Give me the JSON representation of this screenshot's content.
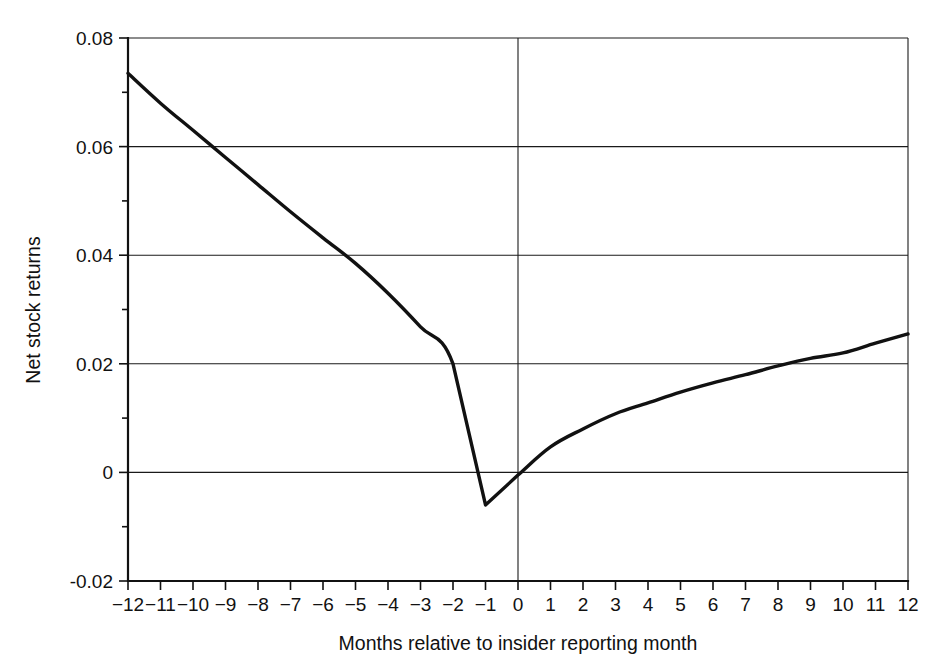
{
  "chart_data": {
    "type": "line",
    "title": "",
    "xlabel": "Months relative to insider reporting month",
    "ylabel": "Net stock returns",
    "xlim": [
      -12,
      12
    ],
    "ylim": [
      -0.02,
      0.08
    ],
    "grid": true,
    "legend": "none",
    "x_tick_labels": [
      "-12",
      "-11",
      "-10",
      "-9",
      "-8",
      "-7",
      "-6",
      "-5",
      "-4",
      "-3",
      "-2",
      "-1",
      "0",
      "1",
      "2",
      "3",
      "4",
      "5",
      "6",
      "7",
      "8",
      "9",
      "10",
      "11",
      "12"
    ],
    "y_tick_labels": [
      "0.08",
      "0.06",
      "0.04",
      "0.02",
      "0",
      "-0.02"
    ],
    "y_tick_values": [
      0.08,
      0.06,
      0.04,
      0.02,
      0,
      -0.02
    ],
    "y_minor_ticks": [
      0.07,
      0.05,
      0.03,
      0.01,
      -0.01
    ],
    "x": [
      -12,
      -11,
      -10,
      -9,
      -8,
      -7,
      -6,
      -5,
      -4,
      -3,
      -2,
      -1,
      0,
      1,
      2,
      3,
      4,
      5,
      6,
      7,
      8,
      9,
      10,
      11,
      12
    ],
    "values": [
      0.0735,
      0.068,
      0.063,
      0.058,
      0.053,
      0.048,
      0.0432,
      0.0385,
      0.033,
      0.0268,
      0.02,
      -0.006,
      -0.0005,
      0.0047,
      0.008,
      0.0108,
      0.0128,
      0.0148,
      0.0165,
      0.018,
      0.0196,
      0.021,
      0.022,
      0.0238,
      0.0255
    ],
    "series": [
      {
        "name": "Net stock returns",
        "values": [
          0.0735,
          0.068,
          0.063,
          0.058,
          0.053,
          0.048,
          0.0432,
          0.0385,
          0.033,
          0.0268,
          0.02,
          -0.006,
          -0.0005,
          0.0047,
          0.008,
          0.0108,
          0.0128,
          0.0148,
          0.0165,
          0.018,
          0.0196,
          0.021,
          0.022,
          0.0238,
          0.0255
        ],
        "color": "#111111"
      }
    ],
    "annotations": [
      {
        "label": "minimum",
        "x": -1,
        "y": -0.006
      },
      {
        "label": "zero-reference-vline",
        "x": 0
      }
    ]
  },
  "colors": {
    "line": "#111111",
    "grid": "#1a1a1a",
    "axis": "#111111",
    "background": "#ffffff"
  }
}
